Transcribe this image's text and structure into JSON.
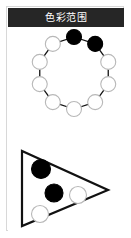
{
  "panel": {
    "header": {
      "title": "色彩范围",
      "background_color": "#262626",
      "text_color": "#ffffff"
    },
    "border_color": "#d8d8d8",
    "background_color": "#ffffff"
  },
  "palette": {
    "filled": "#000000",
    "empty": "#ffffff",
    "stroke": "#111111",
    "empty_stroke": "#b8b8b8"
  },
  "ring_diagram": {
    "name": "color-wheel-ring",
    "center_x": 66,
    "center_y": 46,
    "radius": 36,
    "node_radius": 7.5,
    "node_count": 10,
    "nodes": [
      {
        "index": 0,
        "label": "node-1",
        "angle_deg": -90,
        "state": "filled"
      },
      {
        "index": 1,
        "label": "node-2",
        "angle_deg": -54,
        "state": "filled"
      },
      {
        "index": 2,
        "label": "node-3",
        "angle_deg": -18,
        "state": "empty"
      },
      {
        "index": 3,
        "label": "node-4",
        "angle_deg": 18,
        "state": "empty"
      },
      {
        "index": 4,
        "label": "node-5",
        "angle_deg": 54,
        "state": "empty"
      },
      {
        "index": 5,
        "label": "node-6",
        "angle_deg": 90,
        "state": "empty"
      },
      {
        "index": 6,
        "label": "node-7",
        "angle_deg": 126,
        "state": "empty"
      },
      {
        "index": 7,
        "label": "node-8",
        "angle_deg": 162,
        "state": "empty"
      },
      {
        "index": 8,
        "label": "node-9",
        "angle_deg": 198,
        "state": "empty"
      },
      {
        "index": 9,
        "label": "node-10",
        "angle_deg": 234,
        "state": "empty"
      }
    ],
    "selected_count": 2,
    "total_count": 10
  },
  "triangle_diagram": {
    "name": "color-range-triangle",
    "direction": "right",
    "points": "14,124 14,199 100,163",
    "stroke_color": "#111111",
    "stroke_width": 2.2,
    "nodes": [
      {
        "label": "swatch-1",
        "cx": 33,
        "cy": 142,
        "r": 9.5,
        "state": "filled"
      },
      {
        "label": "swatch-2",
        "cx": 46,
        "cy": 166,
        "r": 9,
        "state": "filled"
      },
      {
        "label": "swatch-3",
        "cx": 70,
        "cy": 168,
        "r": 8.5,
        "state": "empty"
      },
      {
        "label": "swatch-4",
        "cx": 32,
        "cy": 187,
        "r": 8.5,
        "state": "empty"
      }
    ],
    "filled_count": 2,
    "empty_count": 2
  }
}
